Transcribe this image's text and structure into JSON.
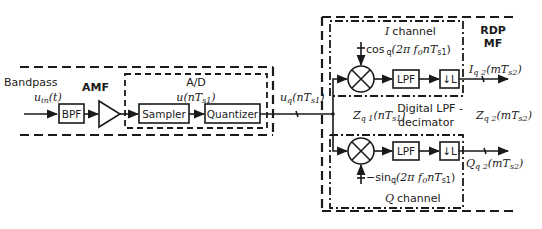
{
  "diagram": {
    "input": {
      "label": "Bandpass",
      "signal": "u",
      "signal_sub": "in",
      "signal_arg": "(t)"
    },
    "blocks": {
      "bpf": "BPF",
      "amf_label": "AMF",
      "ad_label": "A/D",
      "ad_signal": "u",
      "ad_signal_arg_pre": "(n",
      "ad_signal_T": "T",
      "ad_signal_T_sub": "s1",
      "ad_signal_arg_post": ")",
      "sampler": "Sampler",
      "quantizer": "Quantizer"
    },
    "quantized_signal": {
      "sym": "u",
      "sub": "q",
      "arg_pre": "(n",
      "T": "T",
      "T_sub": "s1",
      "arg_post": ")"
    },
    "rdp": {
      "title_line1": "RDP",
      "title_line2": "MF"
    },
    "i_channel": {
      "title": "channel",
      "title_sym": "I",
      "lo_text": "cos",
      "lo_sub": "q",
      "lo_arg": "(2π f",
      "lo_f_sub": "0",
      "lo_arg2": "n",
      "lo_T": "T",
      "lo_T_sub": "s1",
      "lo_close": ")",
      "lpf": "LPF",
      "decim": "↓L",
      "output_sym": "I",
      "output_sub": "q 2",
      "output_arg": "(m",
      "output_T": "T",
      "output_T_sub": "s2",
      "output_close": ")"
    },
    "q_channel": {
      "title": "channel",
      "title_sym": "Q",
      "lo_text": "−sin",
      "lo_sub": "q",
      "lo_arg": "(2π f",
      "lo_f_sub": "0",
      "lo_arg2": "n",
      "lo_T": "T",
      "lo_T_sub": "s1",
      "lo_close": ")",
      "lpf": "LPF",
      "decim": "↓L",
      "output_sym": "Q",
      "output_sub": "q 2",
      "output_arg": "(m",
      "output_T": "T",
      "output_T_sub": "s2",
      "output_close": ")"
    },
    "middle": {
      "z1_sym": "Z",
      "z1_sub": "q 1",
      "z1_arg": "(n",
      "z1_T": "T",
      "z1_T_sub": "s1",
      "z1_close": ")",
      "lpf_line1": "Digital LPF -",
      "lpf_line2": "decimator",
      "z2_sym": "Z",
      "z2_sub": "q 2",
      "z2_arg": "(m",
      "z2_T": "T",
      "z2_T_sub": "s2",
      "z2_close": ")"
    }
  }
}
